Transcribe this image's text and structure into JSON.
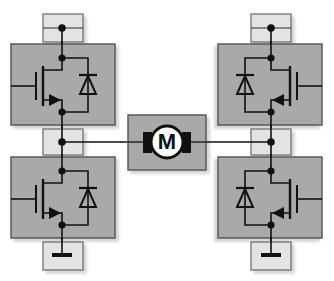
{
  "diagram": {
    "type": "H-bridge motor driver",
    "motor": {
      "label": "M"
    },
    "terminals": {
      "top_left": "supply",
      "top_right": "supply",
      "mid_left": "output-node",
      "mid_right": "output-node",
      "bottom_left": "ground",
      "bottom_right": "ground"
    },
    "switches": [
      {
        "position": "high-side-left",
        "device": "MOSFET with flyback diode"
      },
      {
        "position": "low-side-left",
        "device": "MOSFET with flyback diode"
      },
      {
        "position": "high-side-right",
        "device": "MOSFET with flyback diode"
      },
      {
        "position": "low-side-right",
        "device": "MOSFET with flyback diode"
      }
    ],
    "colors": {
      "switch_fill": "#a9a9a9",
      "terminal_fill": "#e3e3e3",
      "motor_box_fill": "#a9a9a9",
      "wire": "#111111",
      "border": "#555555"
    }
  }
}
